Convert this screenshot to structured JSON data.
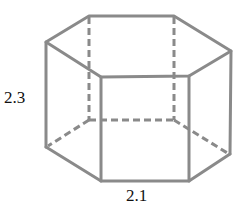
{
  "figure": {
    "type": "hexagonal-prism",
    "labels": {
      "height": "2.3",
      "base_edge": "2.1"
    },
    "colors": {
      "edge": "#8a8a8a",
      "text": "#111111"
    }
  }
}
